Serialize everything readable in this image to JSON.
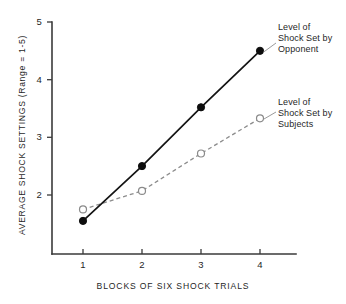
{
  "figure": {
    "background_color": "#ffffff",
    "axis_color": "#3a3a3a"
  },
  "chart_data": {
    "type": "line",
    "title": "",
    "subtitle": "",
    "xlabel": "BLOCKS OF SIX SHOCK TRIALS",
    "ylabel": "AVERAGE SHOCK SETTINGS (Range = 1-5)",
    "categories": [
      "1",
      "2",
      "3",
      "4"
    ],
    "x": [
      1,
      2,
      3,
      4
    ],
    "xlim": [
      0.6,
      4.6
    ],
    "ylim": [
      1.0,
      5.0
    ],
    "yticks": [
      2,
      3,
      4,
      5
    ],
    "ytick_labels": [
      "2",
      "3",
      "4",
      "5"
    ],
    "xticks": [
      1,
      2,
      3,
      4
    ],
    "xtick_labels": [
      "1",
      "2",
      "3",
      "4"
    ],
    "grid": false,
    "legend_position": "annotations-right",
    "series": [
      {
        "name": "Level of Shock Set by Opponent",
        "values": [
          1.55,
          2.5,
          3.52,
          4.5
        ],
        "line_style": "solid",
        "color": "#141414",
        "marker": "filled-circle"
      },
      {
        "name": "Level of Shock Set by Subjects",
        "values": [
          1.75,
          2.07,
          2.72,
          3.33
        ],
        "line_style": "dashed",
        "color": "#8c8c8c",
        "marker": "open-circle"
      }
    ],
    "annotations": [
      {
        "id": "opponent",
        "lines": [
          "Level of",
          "Shock Set by",
          "Opponent"
        ],
        "points_to_series": "Level of Shock Set by Opponent"
      },
      {
        "id": "subjects",
        "lines": [
          "Level of",
          "Shock Set by",
          "Subjects"
        ],
        "points_to_series": "Level of Shock Set by Subjects"
      }
    ]
  },
  "axis": {
    "y_tick_5": "5",
    "y_tick_4": "4",
    "y_tick_3": "3",
    "y_tick_2": "2",
    "x_tick_1": "1",
    "x_tick_2": "2",
    "x_tick_3": "3",
    "x_tick_4": "4"
  },
  "annotations": {
    "opponent": {
      "line1": "Level of",
      "line2": "Shock Set by",
      "line3": "Opponent"
    },
    "subjects": {
      "line1": "Level of",
      "line2": "Shock Set by",
      "line3": "Subjects"
    }
  },
  "labels": {
    "x_axis_title": "BLOCKS OF SIX SHOCK TRIALS",
    "y_axis_title": "AVERAGE SHOCK SETTINGS (Range = 1-5)"
  }
}
